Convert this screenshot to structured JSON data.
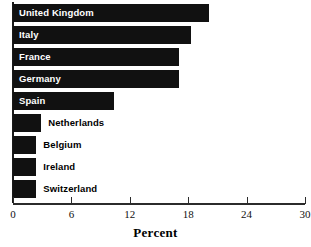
{
  "chart_data": {
    "type": "bar",
    "orientation": "horizontal",
    "title": "",
    "xlabel": "Percent",
    "ylabel": "",
    "xlim": [
      0,
      30
    ],
    "xticks": [
      0,
      6,
      12,
      18,
      24,
      30
    ],
    "xtick_labels": [
      "0",
      "6",
      "12",
      "18",
      "24",
      "30"
    ],
    "grid": false,
    "legend": null,
    "bar_color": "#111111",
    "categories": [
      "United Kingdom",
      "Italy",
      "France",
      "Germany",
      "Spain",
      "Netherlands",
      "Belgium",
      "Ireland",
      "Switzerland"
    ],
    "values": [
      20.1,
      18.3,
      17.1,
      17.1,
      10.4,
      2.9,
      2.4,
      2.4,
      2.4
    ],
    "bars": [
      {
        "label": "United Kingdom",
        "value": 20.1,
        "label_position": "inside"
      },
      {
        "label": "Italy",
        "value": 18.3,
        "label_position": "inside"
      },
      {
        "label": "France",
        "value": 17.1,
        "label_position": "inside"
      },
      {
        "label": "Germany",
        "value": 17.1,
        "label_position": "inside"
      },
      {
        "label": "Spain",
        "value": 10.4,
        "label_position": "inside"
      },
      {
        "label": "Netherlands",
        "value": 2.9,
        "label_position": "outside"
      },
      {
        "label": "Belgium",
        "value": 2.4,
        "label_position": "outside"
      },
      {
        "label": "Ireland",
        "value": 2.4,
        "label_position": "outside"
      },
      {
        "label": "Switzerland",
        "value": 2.4,
        "label_position": "outside"
      }
    ]
  },
  "axis": {
    "x_title": "Percent"
  }
}
